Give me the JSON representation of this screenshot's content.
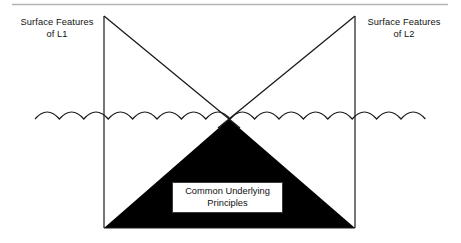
{
  "figure": {
    "title": "Common Underlying Principles",
    "background_color": "#ffffff",
    "ink_color": "#1a1a1a",
    "rule_color": "#b0b0b0",
    "fill_color": "#000000"
  },
  "top_rule": {
    "name": "top-divider-rule"
  },
  "labels": {
    "left": {
      "line1": "Surface Features",
      "line2": "of L1"
    },
    "right": {
      "line1": "Surface Features",
      "line2": "of L2"
    }
  },
  "center_box": {
    "line1": "Common Underlying",
    "line2": "Principles"
  },
  "geometry": {
    "rule_y": 4,
    "rule_x1": 12,
    "rule_x2": 448,
    "left_post_x": 104,
    "right_post_x": 355,
    "post_top_y": 16,
    "baseline_y": 228,
    "crossing_x": 229,
    "crossing_y": 119,
    "wave_y": 119,
    "wave_x1": 35,
    "wave_x2": 425,
    "wave_arc_count": 16,
    "wave_arc_height": 7
  }
}
